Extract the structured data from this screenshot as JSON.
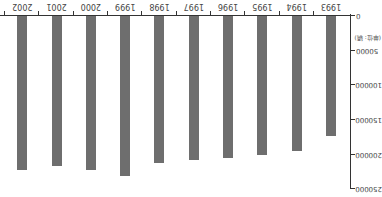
{
  "chart_data": {
    "type": "bar",
    "orientation_note": "image rendered rotated 180 degrees",
    "title": "",
    "xlabel": "",
    "ylabel": "(单位: 辆)",
    "categories": [
      "1993",
      "1994",
      "1995",
      "1996",
      "1997",
      "1998",
      "1999",
      "2000",
      "2001",
      "2002"
    ],
    "values": [
      173000,
      195000,
      200000,
      205000,
      208000,
      212000,
      231000,
      222000,
      216000,
      222000
    ],
    "ylim": [
      0,
      250000
    ],
    "yticks": [
      "0",
      "50000",
      "100000",
      "150000",
      "200000",
      "250000"
    ],
    "grid": false,
    "legend": false,
    "bar_color": "#6e6e6e"
  }
}
